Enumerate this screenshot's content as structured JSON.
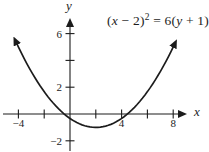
{
  "figure": {
    "background": "#ffffff",
    "ink_color": "#1c1c1c",
    "x_axis_letter": "x",
    "y_axis_letter": "y",
    "equation": {
      "text": "(x − 2)² = 6(y + 1)",
      "parts": [
        {
          "t": "(",
          "style": "roman"
        },
        {
          "t": "x",
          "style": "italic"
        },
        {
          "t": " − 2",
          "style": "roman"
        },
        {
          "t": ")",
          "style": "roman"
        },
        {
          "t": "2",
          "style": "sup"
        },
        {
          "t": " = 6(",
          "style": "roman"
        },
        {
          "t": "y",
          "style": "italic"
        },
        {
          "t": " + 1)",
          "style": "roman"
        }
      ]
    }
  },
  "chart_data": {
    "type": "line",
    "equation_standard_form": "(x − 2)² = 6(y + 1)",
    "function": "y = (x − 2)²/6 − 1",
    "vertex": [
      2,
      -1
    ],
    "focal_coefficient": 6,
    "opens": "upward",
    "xlabel": "x",
    "ylabel": "y",
    "xlim": [
      -5.3,
      9.3
    ],
    "ylim": [
      -2.9,
      7.2
    ],
    "grid": false,
    "x_ticks": [
      {
        "v": -4,
        "label": "−4"
      },
      {
        "v": -2,
        "label": ""
      },
      {
        "v": 2,
        "label": ""
      },
      {
        "v": 4,
        "label": "4"
      },
      {
        "v": 6,
        "label": ""
      },
      {
        "v": 8,
        "label": "8"
      }
    ],
    "y_ticks": [
      {
        "v": -2,
        "label": "−2"
      },
      {
        "v": 2,
        "label": "2"
      },
      {
        "v": 4,
        "label": ""
      },
      {
        "v": 6,
        "label": "6"
      }
    ],
    "curve_x_range": [
      -4.15,
      8.05
    ],
    "sample_points": [
      [
        -4,
        5
      ],
      [
        -2,
        1.67
      ],
      [
        0,
        -0.33
      ],
      [
        2,
        -1
      ],
      [
        4,
        -0.33
      ],
      [
        6,
        1.67
      ],
      [
        8,
        5
      ]
    ]
  }
}
